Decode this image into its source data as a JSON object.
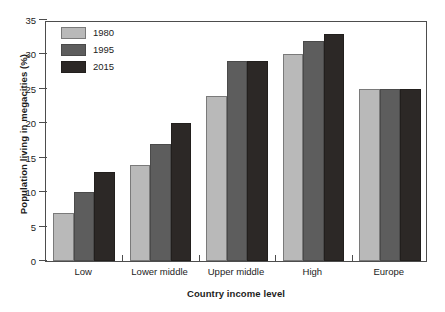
{
  "chart_data": {
    "type": "bar",
    "title": "",
    "xlabel": "Country income level",
    "ylabel": "Population living in megacities (%)",
    "categories": [
      "Low",
      "Lower middle",
      "Upper middle",
      "High",
      "Europe"
    ],
    "series": [
      {
        "name": "1980",
        "color": "#b9b9b9",
        "values": [
          7,
          14,
          24,
          30,
          25
        ]
      },
      {
        "name": "1995",
        "color": "#5d5d5d",
        "values": [
          10,
          17,
          29,
          32,
          25
        ]
      },
      {
        "name": "2015",
        "color": "#2c2826",
        "values": [
          13,
          20,
          29,
          33,
          25
        ]
      }
    ],
    "ylim": [
      0,
      35
    ],
    "yticks": [
      0,
      5,
      10,
      15,
      20,
      25,
      30,
      35
    ],
    "ytick_labels": [
      "0",
      "5",
      "10",
      "15",
      "20",
      "25",
      "30",
      "35"
    ],
    "grid": false,
    "legend_position": "top-left"
  }
}
